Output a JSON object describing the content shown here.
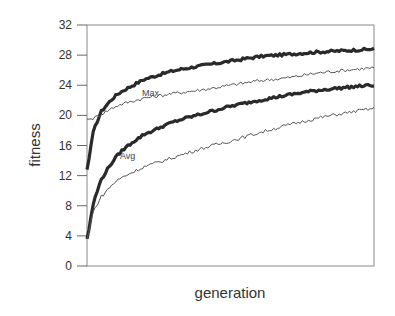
{
  "chart_data": {
    "type": "line",
    "title": "",
    "xlabel": "generation",
    "ylabel": "fitness",
    "ylim": [
      0,
      32
    ],
    "yticks": [
      0,
      4,
      8,
      12,
      16,
      20,
      24,
      28,
      32
    ],
    "xticks": [],
    "grid": false,
    "legend": "inline annotations",
    "annotations": [
      {
        "text": "Max",
        "near_series": "Max (thin)"
      },
      {
        "text": "Avg",
        "near_series": "Avg (thin)"
      }
    ],
    "x": [
      0,
      0.02,
      0.05,
      0.1,
      0.15,
      0.2,
      0.3,
      0.4,
      0.5,
      0.6,
      0.7,
      0.8,
      0.9,
      1.0
    ],
    "series": [
      {
        "name": "Max (thick)",
        "style": "thick",
        "values": [
          12.8,
          17.5,
          20.5,
          22.6,
          23.8,
          24.8,
          25.9,
          26.6,
          27.2,
          27.8,
          28.1,
          28.4,
          28.6,
          28.8
        ]
      },
      {
        "name": "Max (thin)",
        "style": "thin",
        "values": [
          19.5,
          19.6,
          20.2,
          21.2,
          21.8,
          22.3,
          22.9,
          23.4,
          24.0,
          24.6,
          25.0,
          25.6,
          26.0,
          26.3
        ]
      },
      {
        "name": "Avg (thick)",
        "style": "thick",
        "values": [
          3.6,
          8.0,
          11.5,
          14.4,
          16.2,
          17.5,
          19.1,
          20.2,
          21.2,
          22.0,
          22.7,
          23.3,
          23.7,
          24.0
        ]
      },
      {
        "name": "Avg (thin)",
        "style": "thin",
        "values": [
          3.6,
          7.0,
          9.2,
          11.2,
          12.3,
          13.2,
          14.4,
          15.6,
          16.6,
          17.7,
          18.7,
          19.6,
          20.3,
          20.9
        ]
      }
    ]
  },
  "labels": {
    "ylabel": "fitness",
    "xlabel": "generation",
    "max": "Max",
    "avg": "Avg"
  }
}
